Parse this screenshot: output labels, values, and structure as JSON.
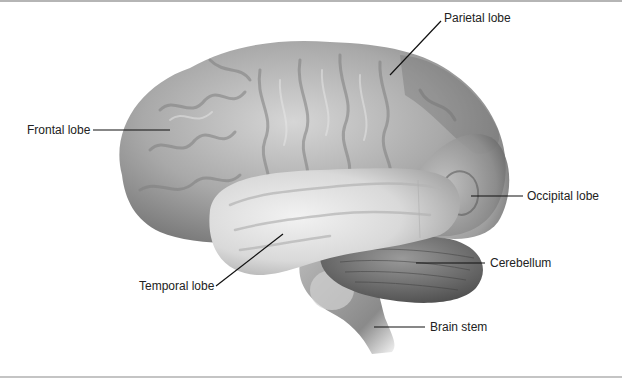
{
  "figure": {
    "labels": [
      {
        "id": "parietal",
        "text": "Parietal lobe",
        "x": 464,
        "y": 15
      },
      {
        "id": "frontal",
        "text": "Frontal lobe",
        "x": 26,
        "y": 122
      },
      {
        "id": "occipital",
        "text": "Occipital lobe",
        "x": 528,
        "y": 190
      },
      {
        "id": "cerebellum",
        "text": "Cerebellum",
        "x": 491,
        "y": 257
      },
      {
        "id": "temporal",
        "text": "Temporal lobe",
        "x": 139,
        "y": 282
      },
      {
        "id": "brainstem",
        "text": "Brain stem",
        "x": 430,
        "y": 320
      }
    ],
    "colors": {
      "label_text": "#222222",
      "leader_line": "#111111",
      "frame": "#b5b5b5",
      "background": "#ffffff"
    }
  }
}
